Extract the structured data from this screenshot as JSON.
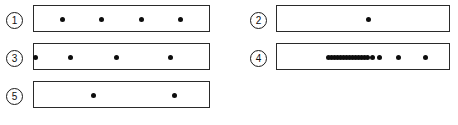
{
  "figure": {
    "type": "dot-strip-panels",
    "panel_count": 5,
    "dot_diameter_px": 5,
    "box_width_px": 177,
    "box_height_px": 27
  },
  "panels": [
    {
      "id": "panel-1",
      "label": "1",
      "box": {
        "x": 33,
        "y": 5,
        "w": 177,
        "h": 27
      },
      "label_pos": {
        "x": 6,
        "y": 12
      },
      "dot_count": 4,
      "dots": [
        {
          "x": 62,
          "y": 19
        },
        {
          "x": 101,
          "y": 19
        },
        {
          "x": 141,
          "y": 19
        },
        {
          "x": 180,
          "y": 19
        }
      ]
    },
    {
      "id": "panel-2",
      "label": "2",
      "box": {
        "x": 276,
        "y": 5,
        "w": 174,
        "h": 27
      },
      "label_pos": {
        "x": 250,
        "y": 12
      },
      "dot_count": 1,
      "dots": [
        {
          "x": 368,
          "y": 19
        }
      ]
    },
    {
      "id": "panel-3",
      "label": "3",
      "box": {
        "x": 33,
        "y": 43,
        "w": 177,
        "h": 27
      },
      "label_pos": {
        "x": 6,
        "y": 50
      },
      "dot_count": 4,
      "dots": [
        {
          "x": 35,
          "y": 57
        },
        {
          "x": 70,
          "y": 57
        },
        {
          "x": 116,
          "y": 57
        },
        {
          "x": 170,
          "y": 57
        }
      ]
    },
    {
      "id": "panel-4",
      "label": "4",
      "box": {
        "x": 276,
        "y": 43,
        "w": 174,
        "h": 27
      },
      "label_pos": {
        "x": 250,
        "y": 50
      },
      "dot_count": 18,
      "dots": [
        {
          "x": 328,
          "y": 57
        },
        {
          "x": 331,
          "y": 57
        },
        {
          "x": 334,
          "y": 57
        },
        {
          "x": 337,
          "y": 57
        },
        {
          "x": 340,
          "y": 57
        },
        {
          "x": 343,
          "y": 57
        },
        {
          "x": 346,
          "y": 57
        },
        {
          "x": 349,
          "y": 57
        },
        {
          "x": 352,
          "y": 57
        },
        {
          "x": 355,
          "y": 57
        },
        {
          "x": 358,
          "y": 57
        },
        {
          "x": 361,
          "y": 57
        },
        {
          "x": 364,
          "y": 57
        },
        {
          "x": 367,
          "y": 57
        },
        {
          "x": 372,
          "y": 57
        },
        {
          "x": 379,
          "y": 57
        },
        {
          "x": 398,
          "y": 57
        },
        {
          "x": 425,
          "y": 57
        }
      ]
    },
    {
      "id": "panel-5",
      "label": "5",
      "box": {
        "x": 33,
        "y": 81,
        "w": 177,
        "h": 27
      },
      "label_pos": {
        "x": 6,
        "y": 88
      },
      "dot_count": 2,
      "dots": [
        {
          "x": 93,
          "y": 95
        },
        {
          "x": 174,
          "y": 95
        }
      ]
    }
  ],
  "colors": {
    "background": "#ffffff",
    "box_border": "#2a2a2a",
    "dot": "#0d0d0d",
    "label_text": "#111111"
  }
}
